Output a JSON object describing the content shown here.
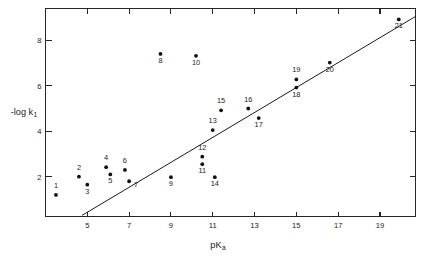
{
  "chart_data": {
    "type": "scatter",
    "title": "",
    "xlabel": "pK",
    "xlabel_sub": "a",
    "ylabel": "-log k",
    "ylabel_sub": "1",
    "xlim": [
      3.0,
      20.7
    ],
    "ylim": [
      0.25,
      9.4
    ],
    "xticks": [
      5,
      7,
      9,
      11,
      13,
      15,
      17,
      19
    ],
    "xtick_labels": [
      "5",
      "7",
      "9",
      "11",
      "13",
      "15",
      "17",
      "19"
    ],
    "yticks": [
      2,
      4,
      6,
      8
    ],
    "ytick_labels": [
      "2",
      "4",
      "6",
      "8"
    ],
    "grid": false,
    "legend": null,
    "marker": "filled-circle",
    "point_label_position": "below-or-above",
    "points": [
      {
        "id": "1",
        "label": "1",
        "x": 3.5,
        "y": 1.2,
        "label_dx": 0,
        "label_dy": -7
      },
      {
        "id": "2",
        "label": "2",
        "x": 4.6,
        "y": 2.0,
        "label_dx": 0,
        "label_dy": -7
      },
      {
        "id": "3",
        "label": "3",
        "x": 5.0,
        "y": 1.65,
        "label_dx": 0,
        "label_dy": 9
      },
      {
        "id": "4",
        "label": "4",
        "x": 5.9,
        "y": 2.42,
        "label_dx": 0,
        "label_dy": -7
      },
      {
        "id": "5",
        "label": "5",
        "x": 6.1,
        "y": 2.1,
        "label_dx": 0,
        "label_dy": 9
      },
      {
        "id": "6",
        "label": "6",
        "x": 6.8,
        "y": 2.3,
        "label_dx": 0,
        "label_dy": -7
      },
      {
        "id": "7",
        "label": "7",
        "x": 7.0,
        "y": 1.8,
        "label_dx": 7,
        "label_dy": 6
      },
      {
        "id": "8",
        "label": "8",
        "x": 8.5,
        "y": 7.4,
        "label_dx": 0,
        "label_dy": 9
      },
      {
        "id": "9",
        "label": "9",
        "x": 9.0,
        "y": 1.98,
        "label_dx": 0,
        "label_dy": 9
      },
      {
        "id": "10",
        "label": "10",
        "x": 10.2,
        "y": 7.32,
        "label_dx": 0,
        "label_dy": 9
      },
      {
        "id": "11",
        "label": "11",
        "x": 10.5,
        "y": 2.55,
        "label_dx": 0,
        "label_dy": 9
      },
      {
        "id": "12",
        "label": "12",
        "x": 10.5,
        "y": 2.88,
        "label_dx": 0,
        "label_dy": -7
      },
      {
        "id": "13",
        "label": "13",
        "x": 11.0,
        "y": 4.05,
        "label_dx": 0,
        "label_dy": -7
      },
      {
        "id": "14",
        "label": "14",
        "x": 11.1,
        "y": 1.98,
        "label_dx": 0,
        "label_dy": 9
      },
      {
        "id": "15",
        "label": "15",
        "x": 11.4,
        "y": 4.92,
        "label_dx": 0,
        "label_dy": -7
      },
      {
        "id": "16",
        "label": "16",
        "x": 12.7,
        "y": 5.0,
        "label_dx": 0,
        "label_dy": -7
      },
      {
        "id": "17",
        "label": "17",
        "x": 13.2,
        "y": 4.58,
        "label_dx": 0,
        "label_dy": 9
      },
      {
        "id": "18",
        "label": "18",
        "x": 15.0,
        "y": 5.92,
        "label_dx": 0,
        "label_dy": 9
      },
      {
        "id": "19",
        "label": "19",
        "x": 15.0,
        "y": 6.28,
        "label_dx": 0,
        "label_dy": -7
      },
      {
        "id": "20",
        "label": "20",
        "x": 16.6,
        "y": 7.02,
        "label_dx": 0,
        "label_dy": 9
      },
      {
        "id": "21",
        "label": "21",
        "x": 19.9,
        "y": 8.92,
        "label_dx": 0,
        "label_dy": 9
      }
    ],
    "trend_line": {
      "x0": 4.75,
      "y0": 0.3,
      "x1": 20.7,
      "y1": 9.05
    },
    "colors": {
      "axis": "#262626",
      "marker": "#111111",
      "trend": "#1a1a1a",
      "text": "#1a1a1a",
      "background": "#ffffff"
    }
  }
}
